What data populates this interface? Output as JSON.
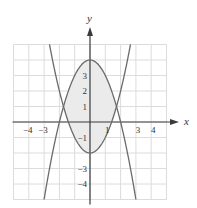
{
  "chart_data": {
    "type": "line",
    "title": "",
    "xlabel": "x",
    "ylabel": "y",
    "xlim": [
      -5,
      5
    ],
    "ylim": [
      -5,
      5
    ],
    "grid": true,
    "legend": null,
    "x_tick_labels": [
      {
        "value": -4,
        "label": "−4"
      },
      {
        "value": -3,
        "label": "−3"
      },
      {
        "value": 1,
        "label": "1"
      },
      {
        "value": 3,
        "label": "3"
      },
      {
        "value": 4,
        "label": "4"
      }
    ],
    "y_tick_labels": [
      {
        "value": 3,
        "label": "3"
      },
      {
        "value": 2,
        "label": "2"
      },
      {
        "value": 1,
        "label": "1"
      },
      {
        "value": -1,
        "label": "−1"
      },
      {
        "value": -3,
        "label": "−3"
      },
      {
        "value": -4,
        "label": "−4"
      }
    ],
    "series": [
      {
        "name": "y = 4 − x²",
        "a": -1,
        "c": 4,
        "x_range": [
          -3,
          3
        ]
      },
      {
        "name": "y = x² − 2",
        "a": 1,
        "c": -2,
        "x_range": [
          -2.646,
          2.646
        ]
      }
    ],
    "shaded_region": {
      "description": "region between y = 4 − x² and y = x² − 2",
      "x_range": [
        -1.732,
        1.732
      ],
      "intersections": [
        [
          -1.732,
          1
        ],
        [
          1.732,
          1
        ]
      ]
    }
  },
  "colors": {
    "grid": "#dcdcdc",
    "axis": "#3a3a3a",
    "curve": "#6a6a6a",
    "fill": "#ebebeb"
  }
}
